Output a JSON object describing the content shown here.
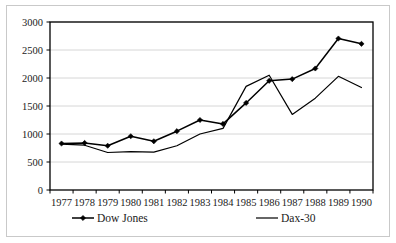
{
  "chart_data": {
    "type": "line",
    "title": "",
    "xlabel": "",
    "ylabel": "",
    "categories": [
      "1977",
      "1978",
      "1979",
      "1980",
      "1981",
      "1982",
      "1983",
      "1984",
      "1985",
      "1986",
      "1987",
      "1988",
      "1989",
      "1990"
    ],
    "yticks": [
      "0",
      "500",
      "1000",
      "1500",
      "2000",
      "2500",
      "3000"
    ],
    "ylim": [
      0,
      3000
    ],
    "grid": true,
    "legend_position": "bottom",
    "series": [
      {
        "name": "Dow Jones",
        "marker": "diamond",
        "color": "#000000",
        "values": [
          830,
          840,
          790,
          960,
          870,
          1050,
          1250,
          1180,
          1555,
          1950,
          1980,
          2170,
          2705,
          2610
        ]
      },
      {
        "name": "Dax-30",
        "marker": "none",
        "color": "#000000",
        "values": [
          820,
          800,
          670,
          685,
          675,
          790,
          1000,
          1100,
          1850,
          2050,
          1350,
          1640,
          2030,
          1830
        ]
      }
    ]
  },
  "legend": {
    "items": [
      {
        "label": "Dow Jones",
        "marker": "diamond"
      },
      {
        "label": "Dax-30",
        "marker": "none"
      }
    ]
  },
  "axes": {
    "y_tick_labels": [
      "3000",
      "2500",
      "2000",
      "1500",
      "1000",
      "500",
      "0"
    ],
    "x_tick_labels": [
      "1977",
      "1978",
      "1979",
      "1980",
      "1981",
      "1982",
      "1983",
      "1984",
      "1985",
      "1986",
      "1987",
      "1988",
      "1989",
      "1990"
    ]
  }
}
